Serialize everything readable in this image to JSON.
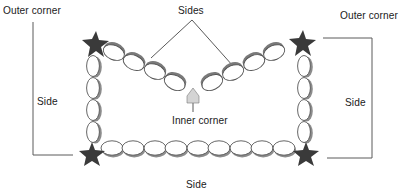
{
  "diagram": {
    "labels": {
      "outer_corner_left": "Outer corner",
      "outer_corner_right": "Outer corner",
      "sides_top": "Sides",
      "side_left": "Side",
      "side_right": "Side",
      "inner_corner": "Inner corner",
      "side_bottom": "Side"
    },
    "colors": {
      "star": "#3a3a3a",
      "bead_outline": "#555555",
      "bead_shadow": "#8c8c8c",
      "bead_fill": "#ffffff",
      "leader_line": "#555555",
      "inner_corner_pointer": "#d0d0d0"
    },
    "elements": {
      "corners": [
        "top-left",
        "top-right",
        "bottom-left",
        "bottom-right"
      ],
      "inner_corner": "top-center V point"
    }
  }
}
